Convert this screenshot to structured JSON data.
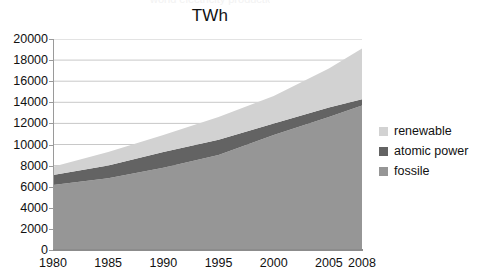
{
  "chart_data": {
    "type": "area",
    "stacked": true,
    "title": "TWh",
    "subtitle_cropped": "world electricity production",
    "xlabel": "",
    "ylabel": "",
    "x": [
      1980,
      1985,
      1990,
      1995,
      2000,
      2005,
      2008
    ],
    "categories": [
      "1980",
      "1985",
      "1990",
      "1995",
      "2000",
      "2005",
      "2008"
    ],
    "xlim": [
      1980,
      2008
    ],
    "ylim": [
      0,
      20000
    ],
    "ytick_labels": [
      "0",
      "2000",
      "4000",
      "6000",
      "8000",
      "10000",
      "12000",
      "14000",
      "16000",
      "18000",
      "20000"
    ],
    "ytick_values": [
      0,
      2000,
      4000,
      6000,
      8000,
      10000,
      12000,
      14000,
      16000,
      18000,
      20000
    ],
    "ytick_step": 2000,
    "grid": true,
    "grid_axis": "y",
    "legend_position": "right",
    "series": [
      {
        "name": "fossile",
        "color": "#969696",
        "values": [
          6150,
          6800,
          7800,
          9000,
          10900,
          12600,
          13700
        ]
      },
      {
        "name": "atomic power",
        "color": "#636363",
        "values": [
          950,
          1200,
          1500,
          1450,
          1100,
          900,
          600
        ]
      },
      {
        "name": "renewable",
        "color": "#d2d2d2",
        "values": [
          800,
          1300,
          1600,
          2150,
          2600,
          3700,
          4800
        ]
      }
    ],
    "cumulative_tops": {
      "fossile": [
        6150,
        6800,
        7800,
        9000,
        10900,
        12600,
        13700
      ],
      "atomic power": [
        7100,
        8000,
        9300,
        10450,
        12000,
        13500,
        14300
      ],
      "renewable": [
        7900,
        9300,
        10900,
        12600,
        14600,
        17200,
        19100
      ]
    }
  },
  "legend": {
    "items": [
      {
        "label": "renewable",
        "color": "#d2d2d2"
      },
      {
        "label": "atomic power",
        "color": "#636363"
      },
      {
        "label": "fossile",
        "color": "#969696"
      }
    ]
  },
  "colors": {
    "renewable": "#d2d2d2",
    "atomic_power": "#636363",
    "fossile": "#969696",
    "grid": "#c8c8c8",
    "axis": "#8c8c8c",
    "text": "#111111",
    "background": "#ffffff"
  }
}
